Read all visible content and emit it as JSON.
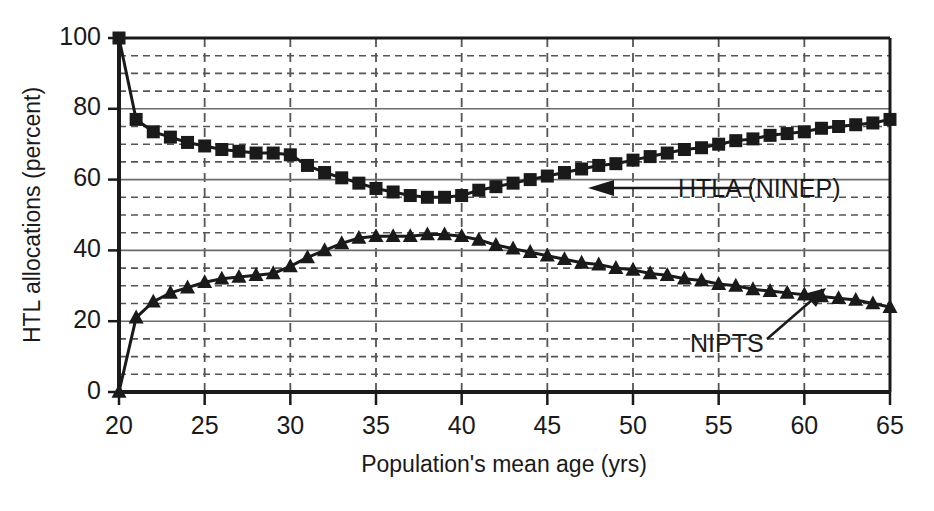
{
  "chart_data": {
    "type": "line",
    "title": "",
    "xlabel": "Population's mean age (yrs)",
    "ylabel": "HTL allocations (percent)",
    "xlim": [
      20,
      65
    ],
    "ylim": [
      0,
      100
    ],
    "xticks": [
      20,
      25,
      30,
      35,
      40,
      45,
      50,
      55,
      60,
      65
    ],
    "yticks": [
      0,
      20,
      40,
      60,
      80,
      100
    ],
    "xtick_labels": [
      "20",
      "25",
      "30",
      "35",
      "40",
      "45",
      "50",
      "55",
      "60",
      "65"
    ],
    "ytick_labels": [
      "0",
      "20",
      "40",
      "60",
      "80",
      "100"
    ],
    "x_minor_step": 5,
    "y_minor_step": 5,
    "grid": "dashed minor gridlines on both axes, solid major horizontal lines",
    "legend_position": "inline annotations with arrows",
    "series": [
      {
        "name": "HTLA (NINEP)",
        "marker": "square",
        "x": [
          20,
          21,
          22,
          23,
          24,
          25,
          26,
          27,
          28,
          29,
          30,
          31,
          32,
          33,
          34,
          35,
          36,
          37,
          38,
          39,
          40,
          41,
          42,
          43,
          44,
          45,
          46,
          47,
          48,
          49,
          50,
          51,
          52,
          53,
          54,
          55,
          56,
          57,
          58,
          59,
          60,
          61,
          62,
          63,
          64,
          65
        ],
        "values": [
          100,
          77,
          73.5,
          72,
          70.5,
          69.5,
          68.5,
          68,
          67.5,
          67.5,
          67,
          64,
          62,
          60.5,
          59,
          57.5,
          56.5,
          55.5,
          55,
          55,
          55.5,
          57,
          58,
          59,
          60,
          61,
          62,
          63,
          64,
          64.5,
          65.5,
          66.5,
          67.5,
          68.5,
          69,
          70,
          71,
          71.5,
          72.5,
          73,
          73.5,
          74.5,
          75,
          75.5,
          76,
          77
        ]
      },
      {
        "name": "NIPTS",
        "marker": "triangle",
        "x": [
          20,
          21,
          22,
          23,
          24,
          25,
          26,
          27,
          28,
          29,
          30,
          31,
          32,
          33,
          34,
          35,
          36,
          37,
          38,
          39,
          40,
          41,
          42,
          43,
          44,
          45,
          46,
          47,
          48,
          49,
          50,
          51,
          52,
          53,
          54,
          55,
          56,
          57,
          58,
          59,
          60,
          61,
          62,
          63,
          64,
          65
        ],
        "values": [
          0,
          21,
          25.5,
          28,
          29.5,
          31,
          32,
          32.5,
          33,
          33.5,
          35.5,
          38,
          40,
          42,
          43.5,
          44,
          44,
          44,
          44.5,
          44.5,
          44,
          43,
          41.5,
          40.5,
          39.5,
          38.5,
          37.5,
          36.5,
          36,
          35,
          34.5,
          33.5,
          33,
          32,
          31.5,
          30.5,
          30,
          29,
          28.5,
          28,
          27.5,
          27,
          26.5,
          26,
          25,
          24
        ]
      }
    ],
    "annotations": [
      {
        "text": "HTLA (NINEP)",
        "arrow": "left",
        "target_series": "HTLA (NINEP)"
      },
      {
        "text": "NIPTS",
        "arrow": "up-right",
        "target_series": "NIPTS"
      }
    ]
  },
  "colors": {
    "ink": "#1a1a1a",
    "grid": "#555555",
    "background": "#ffffff"
  }
}
